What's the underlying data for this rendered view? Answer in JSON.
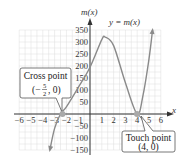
{
  "chart_data": {
    "type": "line",
    "title": "y = m(x)",
    "xlabel": "x",
    "ylabel": "m(x)",
    "xlim": [
      -6,
      6
    ],
    "ylim": [
      -150,
      350
    ],
    "x_ticks": [
      -6,
      -5,
      -4,
      -3,
      -2,
      -1,
      1,
      2,
      3,
      4,
      5,
      6
    ],
    "y_ticks": [
      -150,
      -100,
      -50,
      50,
      100,
      150,
      200,
      250,
      300,
      350
    ],
    "grid": true,
    "series": [
      {
        "name": "y = m(x)",
        "x": [
          -3.4,
          -3.0,
          -2.5,
          -2.0,
          -1.0,
          0,
          1.0,
          1.3,
          2.0,
          3.0,
          4.0,
          4.5,
          5.0,
          5.3
        ],
        "y": [
          -150,
          -60,
          0,
          30,
          110,
          195,
          310,
          320,
          285,
          130,
          0,
          80,
          230,
          350
        ]
      }
    ],
    "annotations": [
      {
        "label": "Cross point",
        "point": "(-5/2, 0)",
        "x": -2.5,
        "y": 0
      },
      {
        "label": "Touch point",
        "point": "(4, 0)",
        "x": 4,
        "y": 0
      }
    ]
  },
  "labels": {
    "curve": "y = m(x)",
    "y_axis": "m(x)",
    "x_axis": "x",
    "cross_title": "Cross point",
    "touch_title": "Touch point",
    "touch_point": "(4, 0)",
    "cross_point_num": "5",
    "cross_point_den": "2"
  },
  "colors": {
    "curve": "#8a8a8a",
    "grid": "#dcdcdc",
    "axis": "#333333",
    "point": "#a9a9a9"
  }
}
